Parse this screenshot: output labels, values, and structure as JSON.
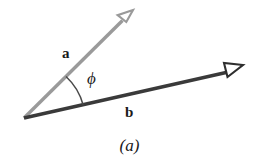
{
  "figure": {
    "caption": "(a)",
    "background_color": "#ffffff",
    "width": 259,
    "height": 167,
    "origin": {
      "x": 24,
      "y": 118
    },
    "vectors": [
      {
        "name": "a",
        "label": "a",
        "color": "#9a9a9a",
        "tip": {
          "x": 133,
          "y": 10
        },
        "stroke_width": 3.2,
        "arrowhead": "open-outline",
        "label_position": {
          "x": 62,
          "y": 46
        }
      },
      {
        "name": "b",
        "label": "b",
        "color": "#3a3a3a",
        "tip": {
          "x": 243,
          "y": 65
        },
        "stroke_width": 3.2,
        "arrowhead": "open-outline",
        "label_position": {
          "x": 125,
          "y": 105
        }
      }
    ],
    "angle": {
      "label": "ϕ",
      "symbol_name": "phi",
      "arc_color": "#4a4a4a",
      "arc_radius": 60,
      "label_position": {
        "x": 87,
        "y": 70
      }
    }
  }
}
